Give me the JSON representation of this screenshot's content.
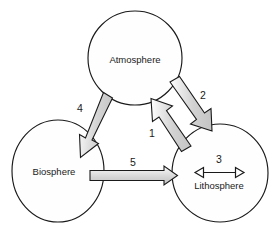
{
  "diagram": {
    "background_color": "#ffffff",
    "outline_color": "#1a1a1a",
    "arrow_fill_color": "#d9d9d9",
    "node_fill_color": "#fefefe",
    "nodes": [
      {
        "id": "atmosphere",
        "label": "Atmosphere",
        "shape": "circle",
        "cx": 135,
        "cy": 58,
        "rx": 47,
        "ry": 47,
        "label_x": 135,
        "label_y": 60
      },
      {
        "id": "biosphere",
        "label": "Biosphere",
        "shape": "ellipse",
        "cx": 58,
        "cy": 171,
        "rx": 46,
        "ry": 51,
        "label_x": 54,
        "label_y": 172
      },
      {
        "id": "lithosphere",
        "label": "Lithosphere",
        "shape": "circle",
        "cx": 220,
        "cy": 173,
        "rx": 48,
        "ry": 49,
        "label_x": 219,
        "label_y": 186
      }
    ],
    "arrows": [
      {
        "id": "arrow-1",
        "number": "1",
        "style": "block",
        "from": "lithosphere",
        "to": "atmosphere",
        "label_x": 152,
        "label_y": 134
      },
      {
        "id": "arrow-2",
        "number": "2",
        "style": "block",
        "from": "atmosphere",
        "to": "lithosphere",
        "label_x": 203,
        "label_y": 96
      },
      {
        "id": "arrow-3",
        "number": "3",
        "style": "thin-double",
        "from": "lithosphere",
        "to": "lithosphere",
        "label_x": 219,
        "label_y": 160
      },
      {
        "id": "arrow-4",
        "number": "4",
        "style": "block",
        "from": "atmosphere",
        "to": "biosphere",
        "label_x": 80,
        "label_y": 109
      },
      {
        "id": "arrow-5",
        "number": "5",
        "style": "block",
        "from": "biosphere",
        "to": "lithosphere",
        "label_x": 133,
        "label_y": 163
      }
    ]
  }
}
